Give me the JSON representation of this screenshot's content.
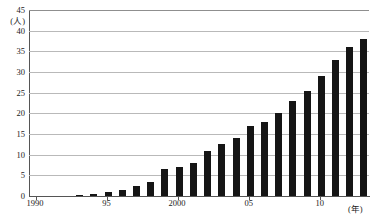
{
  "chart_data": {
    "type": "bar",
    "title": "",
    "subtitle": "",
    "xlabel": "(年)",
    "ylabel": "(人)",
    "ylim": [
      0,
      45
    ],
    "ytick_step": 5,
    "yticks": [
      "0",
      "5",
      "10",
      "15",
      "20",
      "25",
      "30",
      "35",
      "40",
      "45"
    ],
    "grid": true,
    "legend": null,
    "bar_color": "#151515",
    "grid_color": "#b9b9b9",
    "axis_color": "#555555",
    "categories": [
      "1990",
      "1991",
      "1992",
      "1993",
      "1994",
      "1995",
      "1996",
      "1997",
      "1998",
      "1999",
      "2000",
      "2001",
      "2002",
      "2003",
      "2004",
      "2005",
      "2006",
      "2007",
      "2008",
      "2009",
      "2010",
      "2011",
      "2012",
      "2013"
    ],
    "xtick_labels": [
      "1990",
      "95",
      "2000",
      "05",
      "10"
    ],
    "xtick_categories": [
      "1990",
      "1995",
      "2000",
      "2005",
      "2010"
    ],
    "values": [
      0,
      0,
      0,
      0.2,
      0.5,
      1,
      1.5,
      2.5,
      3.5,
      6.5,
      7,
      8,
      11,
      12.5,
      14,
      17,
      18,
      20,
      23,
      25.5,
      29,
      33,
      36,
      38
    ]
  }
}
